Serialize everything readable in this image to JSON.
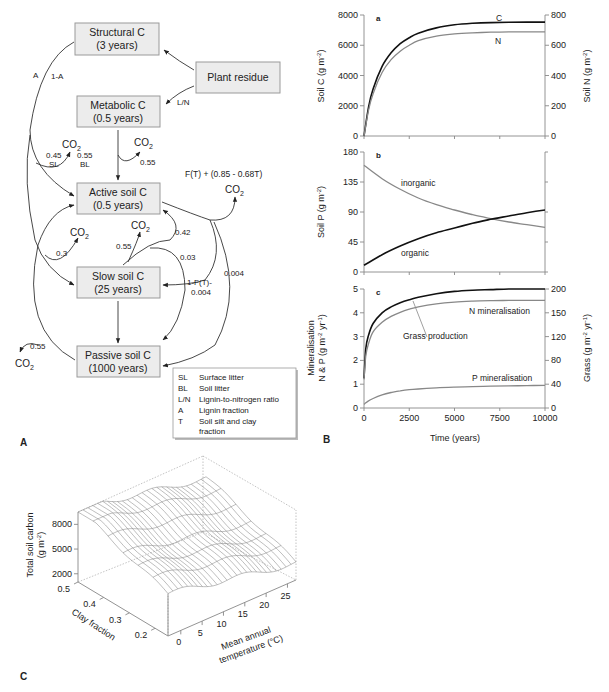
{
  "figure": {
    "panel_labels": {
      "A": "A",
      "B": "B",
      "C": "C"
    }
  },
  "diagram": {
    "boxes": {
      "structural": {
        "line1": "Structural C",
        "line2": "(3 years)"
      },
      "plant": {
        "line1": "Plant residue"
      },
      "metabolic": {
        "line1": "Metabolic C",
        "line2": "(0.5 years)"
      },
      "active": {
        "line1": "Active soil C",
        "line2": "(0.5 years)"
      },
      "slow": {
        "line1": "Slow soil C",
        "line2": "(25 years)"
      },
      "passive": {
        "line1": "Passive soil C",
        "line2": "(1000 years)"
      }
    },
    "flow_labels": {
      "A": "A",
      "one_minus_A": "1-A",
      "LN": "L/N",
      "sl_frac": "0.45",
      "sl": "SL",
      "bl_frac": "0.55",
      "bl": "BL",
      "met_co2": "0.55",
      "active_co2_formula": "F(T) + (0.85 - 0.68T)",
      "slow_co2_left": "0.3",
      "slow_co2": "0.55",
      "slow_to_active": "0.42",
      "slow_to_passive": "0.03",
      "active_to_slow": "1-F(T)-",
      "active_to_slow_2": "0.004",
      "active_to_passive": "0.004",
      "passive_co2": "0.55"
    },
    "co2": "CO",
    "co2_sub": "2",
    "legend": [
      {
        "abbr": "SL",
        "desc": "Surface litter"
      },
      {
        "abbr": "BL",
        "desc": "Soil litter"
      },
      {
        "abbr": "L/N",
        "desc": "Lignin-to-nitrogen ratio"
      },
      {
        "abbr": "A",
        "desc": "Lignin fraction"
      },
      {
        "abbr": "T",
        "desc": "Soil silt and clay",
        "desc2": "fraction"
      }
    ]
  },
  "chart_data": [
    {
      "panel": "a",
      "type": "line",
      "title": "a",
      "x": [
        0,
        250,
        500,
        1000,
        1500,
        2000,
        2500,
        3000,
        4000,
        5000,
        6000,
        7000,
        8000,
        9000,
        10000
      ],
      "xlim": [
        0,
        10000
      ],
      "ylabel": "Soil C (g m-2)",
      "ylim": [
        0,
        8000
      ],
      "yticks": [
        0,
        2000,
        4000,
        6000,
        8000
      ],
      "y2label": "Soil N (g m-2)",
      "y2lim": [
        0,
        800
      ],
      "y2ticks": [
        0,
        200,
        400,
        600,
        800
      ],
      "series": [
        {
          "name": "C",
          "axis": "left",
          "color": "#111111",
          "values": [
            0,
            1900,
            3100,
            4600,
            5500,
            6100,
            6500,
            6800,
            7150,
            7350,
            7450,
            7500,
            7520,
            7530,
            7530
          ]
        },
        {
          "name": "N",
          "axis": "right",
          "color": "#888888",
          "values": [
            0,
            170,
            280,
            420,
            505,
            560,
            600,
            630,
            660,
            675,
            682,
            686,
            688,
            689,
            689
          ]
        }
      ]
    },
    {
      "panel": "b",
      "type": "line",
      "title": "b",
      "x": [
        0,
        1000,
        2000,
        3000,
        4000,
        5000,
        6000,
        7000,
        8000,
        9000,
        10000
      ],
      "xlim": [
        0,
        10000
      ],
      "ylabel": "Soil P (g m-2)",
      "ylim": [
        0,
        180
      ],
      "yticks": [
        0,
        45,
        90,
        135,
        180
      ],
      "series": [
        {
          "name": "inorganic",
          "color": "#888888",
          "values": [
            160,
            140,
            124,
            111,
            101,
            93,
            86,
            80,
            75,
            71,
            67
          ]
        },
        {
          "name": "organic",
          "color": "#111111",
          "values": [
            10,
            26,
            39,
            50,
            59,
            66,
            73,
            79,
            84,
            89,
            93
          ]
        }
      ]
    },
    {
      "panel": "c",
      "type": "line",
      "title": "c",
      "x": [
        0,
        100,
        250,
        500,
        1000,
        1500,
        2000,
        2500,
        3000,
        4000,
        5000,
        6000,
        7000,
        8000,
        9000,
        10000
      ],
      "xlim": [
        0,
        10000
      ],
      "xticks": [
        0,
        2500,
        5000,
        7500,
        10000
      ],
      "xlabel": "Time (years)",
      "ylabel": "Mineralisation N & P (g m-2 yr-1)",
      "ylim": [
        0,
        5
      ],
      "yticks": [
        0,
        1,
        2,
        3,
        4,
        5
      ],
      "y2label": "Grass (g m-2 yr-1)",
      "y2lim": [
        0,
        200
      ],
      "y2ticks": [
        0,
        40,
        80,
        120,
        150,
        200
      ],
      "series": [
        {
          "name": "Grass production",
          "axis": "right",
          "color": "#111111",
          "values": [
            50,
            100,
            122,
            142,
            160,
            170,
            177,
            182,
            186,
            192,
            196,
            198,
            199,
            200,
            200,
            200
          ]
        },
        {
          "name": "N mineralisation",
          "axis": "left",
          "color": "#888888",
          "values": [
            1.2,
            2.2,
            2.7,
            3.2,
            3.6,
            3.85,
            4.02,
            4.15,
            4.25,
            4.38,
            4.45,
            4.49,
            4.51,
            4.52,
            4.52,
            4.52
          ]
        },
        {
          "name": "P mineralisation",
          "axis": "left",
          "color": "#888888",
          "values": [
            0.15,
            0.22,
            0.3,
            0.4,
            0.55,
            0.65,
            0.72,
            0.77,
            0.8,
            0.85,
            0.88,
            0.9,
            0.92,
            0.93,
            0.94,
            0.95
          ]
        }
      ],
      "annotations": [
        "N mineralisation",
        "Grass production",
        "P mineralisation"
      ]
    },
    {
      "panel": "C",
      "type": "surface3d",
      "zlabel": "Total soil carbon (g m-2)",
      "zticks": [
        2000,
        5000,
        8000
      ],
      "ylabel": "Clay fraction",
      "yticks": [
        0.2,
        0.3,
        0.4,
        0.5
      ],
      "xlabel": "Mean annual temperature (°C)",
      "xticks": [
        0,
        5,
        10,
        15,
        20,
        25
      ],
      "description": "Total soil carbon decreases with rising temperature and falling clay fraction; ~8500 g m-2 at 0°C/0.5 clay, ~1500 g m-2 at 27°C/0.15 clay"
    }
  ],
  "axis_text": {
    "a": {
      "ylabel": "Soil C (g m",
      "ylabel_sup": "-2",
      "ylabel_end": ")",
      "y2label": "Soil N (g m",
      "y2label_sup": "-2",
      "y2label_end": ")",
      "label_C": "C",
      "label_N": "N"
    },
    "b": {
      "ylabel": "Soil P (g m",
      "ylabel_sup": "-2",
      "ylabel_end": ")",
      "label_inorganic": "inorganic",
      "label_organic": "organic"
    },
    "c": {
      "ylabel1": "Mineralisation",
      "ylabel2": "N & P (g m",
      "ylabel2_sup": "-2",
      "ylabel2_mid": " yr",
      "ylabel2_sup2": "-1",
      "ylabel2_end": ")",
      "y2label": "Grass (g m",
      "y2label_sup": "-2",
      "y2label_mid": " yr",
      "y2label_sup2": "-1",
      "y2label_end": ")",
      "xlabel": "Time (years)",
      "label_N": "N mineralisation",
      "label_grass": "Grass production",
      "label_P": "P mineralisation"
    },
    "C3d": {
      "zlabel1": "Total soil carbon",
      "zlabel2": "(g m",
      "zlabel2_sup": "-2",
      "zlabel2_end": ")",
      "ylabel": "Clay fraction",
      "xlabel1": "Mean annual",
      "xlabel2": "temperature (°C)"
    }
  }
}
